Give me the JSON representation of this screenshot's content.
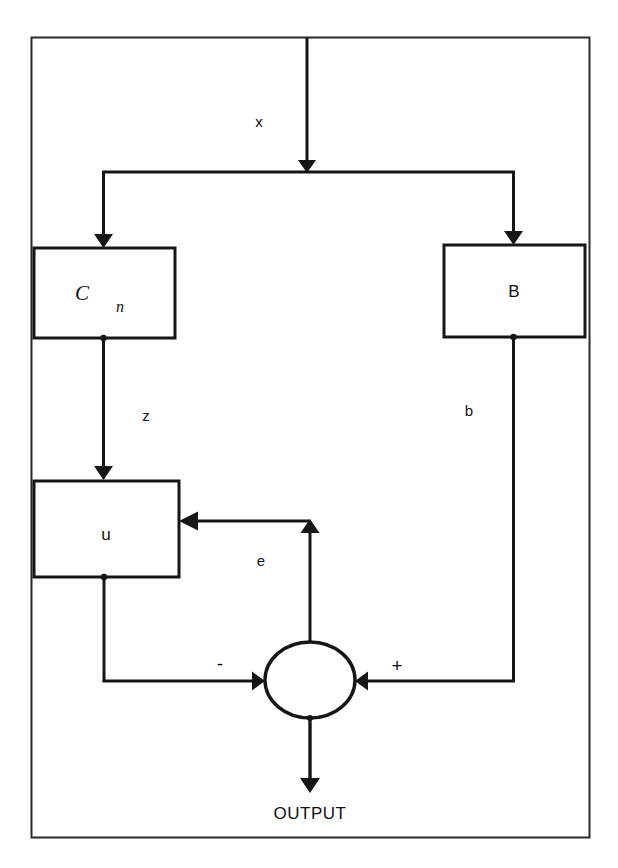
{
  "diagram": {
    "title": "OUTPUT",
    "stroke_color": "#161616",
    "border_color": "#2b2b2b",
    "background": "#ffffff",
    "blocks": [
      {
        "id": "cn",
        "label": "C",
        "subscript": "n",
        "italic": true
      },
      {
        "id": "b",
        "label": "B",
        "subscript": "",
        "italic": false
      },
      {
        "id": "u",
        "label": "u",
        "subscript": "",
        "italic": false
      }
    ],
    "signals": [
      {
        "id": "x",
        "label": "x"
      },
      {
        "id": "z",
        "label": "z"
      },
      {
        "id": "b",
        "label": "b"
      },
      {
        "id": "e",
        "label": "e"
      }
    ],
    "summing_junction": {
      "minus_sign": "-",
      "plus_sign": "+"
    },
    "output_label": "OUTPUT"
  }
}
